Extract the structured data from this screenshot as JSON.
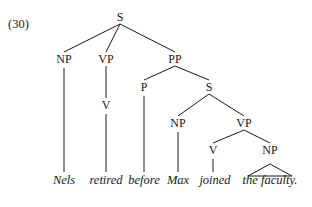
{
  "example_number": "(30)",
  "colors": {
    "ink": "#1a1a1a",
    "background": "#ffffff"
  },
  "tree": {
    "nodes": {
      "S_root": {
        "label": "S",
        "x": 120,
        "y": 17
      },
      "NP1": {
        "label": "NP",
        "x": 64,
        "y": 59
      },
      "VP1": {
        "label": "VP",
        "x": 106,
        "y": 59
      },
      "PP": {
        "label": "PP",
        "x": 175,
        "y": 59
      },
      "V1": {
        "label": "V",
        "x": 106,
        "y": 105
      },
      "P": {
        "label": "P",
        "x": 144,
        "y": 87
      },
      "S2": {
        "label": "S",
        "x": 209,
        "y": 87
      },
      "NP2": {
        "label": "NP",
        "x": 178,
        "y": 123
      },
      "VP2": {
        "label": "VP",
        "x": 244,
        "y": 123
      },
      "V2": {
        "label": "V",
        "x": 213,
        "y": 150
      },
      "NP3": {
        "label": "NP",
        "x": 270,
        "y": 150
      }
    },
    "words": [
      {
        "text": "Nels",
        "x": 64
      },
      {
        "text": "retired",
        "x": 106
      },
      {
        "text": "before",
        "x": 144
      },
      {
        "text": "Max",
        "x": 178
      },
      {
        "text": "joined",
        "x": 215
      },
      {
        "text": "the faculty.",
        "x": 270
      }
    ],
    "word_y": 181,
    "triangle": {
      "apex_x": 270,
      "apex_y": 164,
      "left_x": 248,
      "right_x": 292,
      "base_y": 176
    }
  }
}
